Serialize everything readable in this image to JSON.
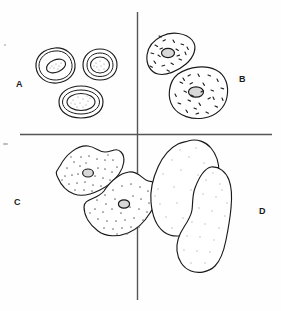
{
  "figure": {
    "background_color": "#fefefe",
    "ink_color": "#1a1a1a",
    "divider_color": "#555555",
    "stipple_color": "#8a8a8a",
    "granule_color": "#222222"
  },
  "dividers": {
    "vertical": {
      "x": 137,
      "y_start": 12,
      "y_end": 300,
      "width": 1.4
    },
    "horizontal": {
      "y": 134,
      "x_start": 20,
      "x_end": 272,
      "width": 1.4
    }
  },
  "panels": [
    {
      "id": "A",
      "label": "A",
      "label_x": 16,
      "label_y": 80,
      "quadrant": "top-left",
      "cell_count": 3,
      "cell_type": "small round cells with large stippled nuclei",
      "cytoplasm_texture": "clear",
      "nucleus_visible": true,
      "cells": [
        {
          "cx": 55,
          "cy": 65,
          "rx": 19,
          "ry": 17,
          "nucleus_rx": 9,
          "nucleus_ry": 6,
          "nucleus_angle": -22
        },
        {
          "cx": 100,
          "cy": 64,
          "rx": 15,
          "ry": 14,
          "nucleus_rx": 9,
          "nucleus_ry": 8,
          "nucleus_angle": 0
        },
        {
          "cx": 81,
          "cy": 102,
          "rx": 21,
          "ry": 15,
          "nucleus_rx": 13,
          "nucleus_ry": 8,
          "nucleus_angle": 0
        }
      ]
    },
    {
      "id": "B",
      "label": "B",
      "label_x": 239,
      "label_y": 75,
      "quadrant": "top-right",
      "cell_count": 2,
      "cell_type": "medium irregular cells with rod-shaped granules",
      "cytoplasm_texture": "coarse dashes",
      "nucleus_visible": true
    },
    {
      "id": "C",
      "label": "C",
      "label_x": 14,
      "label_y": 198,
      "quadrant": "bottom-left",
      "cell_count": 2,
      "cell_type": "large angular cells with dense fine stippling",
      "cytoplasm_texture": "fine dots",
      "nucleus_visible": true
    },
    {
      "id": "D",
      "label": "D",
      "label_x": 259,
      "label_y": 207,
      "quadrant": "bottom-right",
      "cell_count": 2,
      "cell_type": "largest cells with sparse faint stippling, no nucleus",
      "cytoplasm_texture": "sparse faint dots",
      "nucleus_visible": false
    }
  ],
  "artifacts": [
    {
      "name": "edge-speck-left-upper",
      "x": 4,
      "y": 44
    },
    {
      "name": "edge-speck-left-lower",
      "x": 3,
      "y": 143
    }
  ]
}
